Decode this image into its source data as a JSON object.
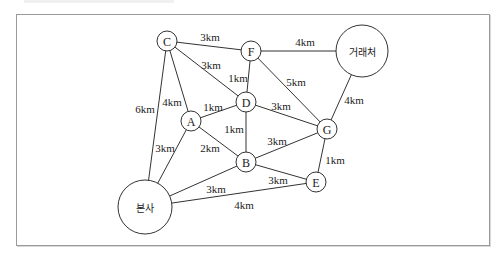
{
  "diagram": {
    "type": "weighted-graph",
    "nodes": [
      {
        "id": "C",
        "label": "C",
        "x": 167,
        "y": 41,
        "r": 10
      },
      {
        "id": "F",
        "label": "F",
        "x": 251,
        "y": 51,
        "r": 10
      },
      {
        "id": "client",
        "label": "거래처",
        "x": 362,
        "y": 51,
        "r": 26
      },
      {
        "id": "D",
        "label": "D",
        "x": 246,
        "y": 102,
        "r": 10
      },
      {
        "id": "A",
        "label": "A",
        "x": 191,
        "y": 121,
        "r": 10
      },
      {
        "id": "G",
        "label": "G",
        "x": 327,
        "y": 129,
        "r": 10
      },
      {
        "id": "B",
        "label": "B",
        "x": 246,
        "y": 162,
        "r": 10
      },
      {
        "id": "E",
        "label": "E",
        "x": 316,
        "y": 182,
        "r": 10
      },
      {
        "id": "hq",
        "label": "본사",
        "x": 145,
        "y": 207,
        "r": 27
      }
    ],
    "edges": [
      {
        "from": "C",
        "to": "F",
        "label": "3km",
        "lx": 210,
        "ly": 37
      },
      {
        "from": "C",
        "to": "D",
        "label": "3km",
        "lx": 211,
        "ly": 65
      },
      {
        "from": "C",
        "to": "A",
        "label": "4km",
        "lx": 172,
        "ly": 102
      },
      {
        "from": "C",
        "to": "hq",
        "label": "6km",
        "lx": 145,
        "ly": 109
      },
      {
        "from": "F",
        "to": "client",
        "label": "4km",
        "lx": 305,
        "ly": 42
      },
      {
        "from": "F",
        "to": "D",
        "label": "1km",
        "lx": 238,
        "ly": 78
      },
      {
        "from": "F",
        "to": "G",
        "label": "5km",
        "lx": 296,
        "ly": 82
      },
      {
        "from": "client",
        "to": "G",
        "label": "4km",
        "lx": 354,
        "ly": 100
      },
      {
        "from": "A",
        "to": "D",
        "label": "1km",
        "lx": 213,
        "ly": 107
      },
      {
        "from": "D",
        "to": "G",
        "label": "3km",
        "lx": 281,
        "ly": 106
      },
      {
        "from": "D",
        "to": "B",
        "label": "1km",
        "lx": 234,
        "ly": 129
      },
      {
        "from": "A",
        "to": "B",
        "label": "2km",
        "lx": 210,
        "ly": 148
      },
      {
        "from": "A",
        "to": "hq",
        "label": "3km",
        "lx": 165,
        "ly": 148
      },
      {
        "from": "B",
        "to": "G",
        "label": "3km",
        "lx": 277,
        "ly": 141
      },
      {
        "from": "G",
        "to": "E",
        "label": "1km",
        "lx": 335,
        "ly": 160
      },
      {
        "from": "B",
        "to": "E",
        "label": "3km",
        "lx": 278,
        "ly": 180
      },
      {
        "from": "B",
        "to": "hq",
        "label": "3km",
        "lx": 216,
        "ly": 189
      },
      {
        "from": "hq",
        "to": "E",
        "label": "4km",
        "lx": 244,
        "ly": 205
      }
    ]
  }
}
